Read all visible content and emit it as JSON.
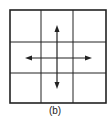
{
  "figure": {
    "caption": "(b)",
    "grid": {
      "rows": 3,
      "cols": 3
    },
    "arrows": [
      "up",
      "down",
      "left",
      "right"
    ],
    "colors": {
      "line": "#222222",
      "background": "#ffffff"
    }
  }
}
